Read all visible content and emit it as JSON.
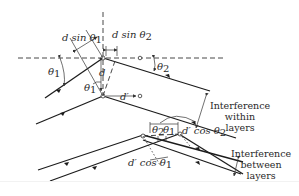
{
  "figure": {
    "labels": {
      "d_sin_theta1": "d sin θ",
      "d_sin_theta1_sub": "1",
      "d_sin_theta2": "d sin θ",
      "d_sin_theta2_sub": "2",
      "theta1_left": "θ",
      "theta1_left_sub": "1",
      "theta2_right": "θ",
      "theta2_right_sub": "2",
      "d_vertical": "d",
      "theta1_inner": "θ",
      "theta1_inner_sub": "1",
      "d_prime": "d′",
      "theta2_lower": "θ",
      "theta2_lower_sub": "2",
      "theta1_lower": "θ",
      "theta1_lower_sub": "1",
      "d_prime_cos_theta2": "d′ cos θ",
      "d_prime_cos_theta2_sub": "2",
      "d_prime_cos_theta1": "d′ cos θ",
      "d_prime_cos_theta1_sub": "1"
    },
    "captions": {
      "within": [
        "Interference",
        "within",
        "layers"
      ],
      "between": [
        "Interference",
        "between",
        "layers"
      ]
    },
    "colors": {
      "line": "#1c1c1c",
      "text": "#2a2a2a",
      "background": "#ffffff"
    }
  }
}
